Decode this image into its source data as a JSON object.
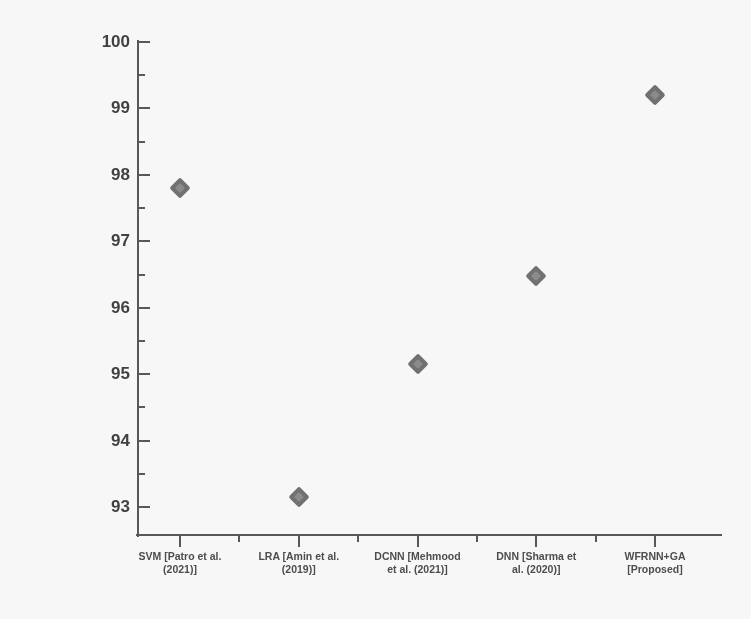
{
  "chart_data": {
    "type": "scatter",
    "title": "",
    "xlabel": "",
    "ylabel": "F1 score (%)",
    "categories": [
      "SVM [Patro et al. (2021)]",
      "LRA [Amin et al. (2019)]",
      "DCNN [Mehmood et al. (2021)]",
      "DNN [Sharma et al. (2020)]",
      "WFRNN+GA [Proposed]"
    ],
    "category_lines": [
      [
        "SVM [Patro et al.",
        "(2021)]"
      ],
      [
        "LRA [Amin et al.",
        "(2019)]"
      ],
      [
        "DCNN [Mehmood",
        "et al. (2021)]"
      ],
      [
        "DNN [Sharma et",
        "al. (2020)]"
      ],
      [
        "WFRNN+GA",
        "[Proposed]"
      ]
    ],
    "values": [
      97.8,
      93.15,
      95.15,
      96.48,
      99.2
    ],
    "ylim": [
      92.6,
      100
    ],
    "ytick_labels": [
      "100",
      "99",
      "98",
      "97",
      "96",
      "95",
      "94",
      "93"
    ],
    "ytick_values": [
      100,
      99,
      98,
      97,
      96,
      95,
      94,
      93
    ],
    "minor_ytick_values": [
      99.5,
      98.5,
      97.5,
      96.5,
      95.5,
      94.5,
      93.5
    ],
    "grid": false,
    "legend": false,
    "marker_shape": "diamond",
    "marker_color": "#707070",
    "axis_color": "#555555"
  }
}
